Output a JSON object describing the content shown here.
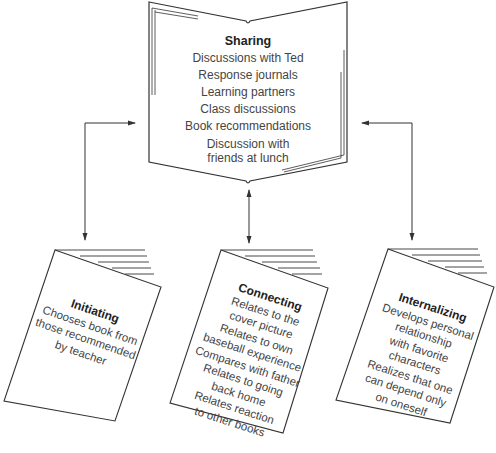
{
  "center_book": {
    "title": "Sharing",
    "items": [
      "Discussions with Ted",
      "Response journals",
      "Learning partners",
      "Class discussions",
      "Book recommendations",
      "Discussion with",
      "friends at lunch"
    ]
  },
  "cards": [
    {
      "title": "Initiating",
      "lines": [
        "Chooses book from",
        "those recommended",
        "by teacher"
      ]
    },
    {
      "title": "Connecting",
      "lines": [
        "Relates to the",
        "cover picture",
        "Relates to own",
        "baseball experience",
        "Compares with father",
        "Relates to going",
        "back home",
        "Relates reaction",
        "to other books"
      ]
    },
    {
      "title": "Internalizing",
      "lines": [
        "Develops personal",
        "relationship",
        "with favorite",
        "characters",
        "Realizes that one",
        "can depend only",
        "on oneself"
      ]
    }
  ],
  "colors": {
    "line": "#333333",
    "text": "#444444"
  }
}
